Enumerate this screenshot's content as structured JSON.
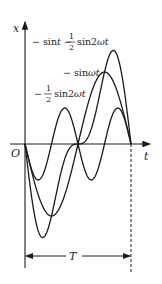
{
  "diagram": {
    "axes": {
      "x_label": "t",
      "y_label": "x",
      "origin_label": "O"
    },
    "curves": [
      {
        "name": "combined",
        "label_prefix": "− sin",
        "label_var": "t",
        "label_mid": " − ",
        "frac_num": "1",
        "frac_den": "2",
        "label_suffix": "sin2",
        "label_suffix_var": "ωt",
        "expr": "-sin t - 1/2 sin 2ωt"
      },
      {
        "name": "fundamental",
        "label_prefix": "− sin",
        "label_var": "ωt",
        "expr": "-sin ωt"
      },
      {
        "name": "second-harmonic",
        "label_prefix": "− ",
        "frac_num": "1",
        "frac_den": "2",
        "label_suffix": "sin2",
        "label_suffix_var": "ωt",
        "expr": "-1/2 sin 2ωt"
      }
    ],
    "period_label": "T",
    "colors": {
      "stroke": "#1a1a1a",
      "background": "#ffffff"
    }
  }
}
